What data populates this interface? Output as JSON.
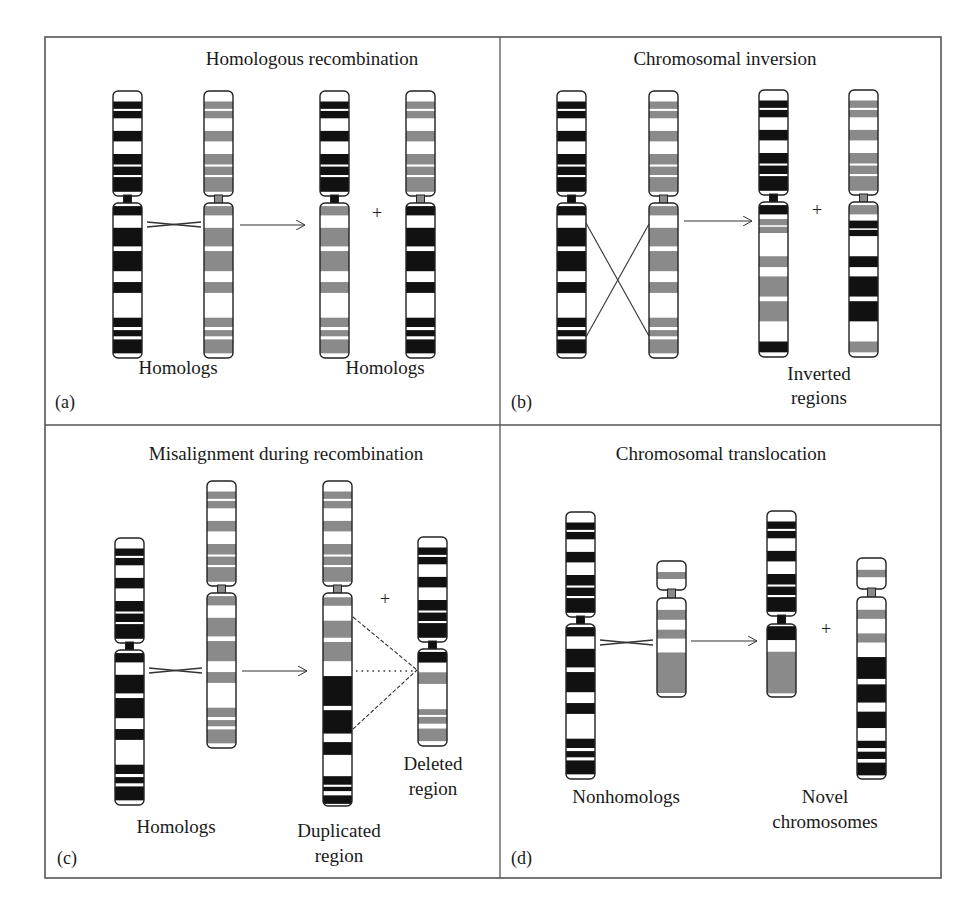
{
  "figure": {
    "frame": {
      "x": 45,
      "y": 37,
      "x2": 941,
      "y2": 878,
      "divider_x": 500,
      "divider_y": 425
    },
    "colors": {
      "dark": "#111111",
      "gray": "#8a8a8a",
      "outline": "#222222",
      "frame": "#555555"
    }
  },
  "patterns": {
    "A_p": [
      [
        0.1,
        0.17,
        "A"
      ],
      [
        0.19,
        0.26,
        "A"
      ],
      [
        0.38,
        0.48,
        "A"
      ],
      [
        0.6,
        0.7,
        "A"
      ],
      [
        0.72,
        0.8,
        "A"
      ],
      [
        0.82,
        0.96,
        "A"
      ]
    ],
    "A_q": [
      [
        0.02,
        0.08,
        "A"
      ],
      [
        0.16,
        0.28,
        "A"
      ],
      [
        0.31,
        0.44,
        "A"
      ],
      [
        0.51,
        0.58,
        "A"
      ],
      [
        0.74,
        0.8,
        "A"
      ],
      [
        0.82,
        0.86,
        "A"
      ],
      [
        0.88,
        0.97,
        "A"
      ]
    ],
    "B_p": [
      [
        0.1,
        0.17,
        "B"
      ],
      [
        0.19,
        0.26,
        "B"
      ],
      [
        0.38,
        0.48,
        "B"
      ],
      [
        0.6,
        0.7,
        "B"
      ],
      [
        0.72,
        0.8,
        "B"
      ],
      [
        0.82,
        0.96,
        "B"
      ]
    ],
    "B_q": [
      [
        0.02,
        0.08,
        "B"
      ],
      [
        0.16,
        0.28,
        "B"
      ],
      [
        0.31,
        0.44,
        "B"
      ],
      [
        0.51,
        0.58,
        "B"
      ],
      [
        0.74,
        0.8,
        "B"
      ],
      [
        0.82,
        0.86,
        "B"
      ],
      [
        0.88,
        0.97,
        "B"
      ]
    ]
  },
  "panels": [
    {
      "id": "a",
      "tag": "(a)",
      "title": "Homologous recombination",
      "title_pos": {
        "x": 272,
        "y": 58
      },
      "tag_pos": {
        "x": 53,
        "y": 398
      },
      "captions": [
        {
          "text": "Homologs",
          "x": 178,
          "y": 368
        },
        {
          "text": "Homologs",
          "x": 385,
          "y": 368
        }
      ],
      "chromosomes": [
        {
          "name": "chromosome-a1",
          "x": 113,
          "y": 91,
          "w": 29,
          "p": 105,
          "c": 7,
          "q": 155,
          "p_bands": "A_p",
          "q_bands": "A_q",
          "cen": "dark"
        },
        {
          "name": "chromosome-a2",
          "x": 204,
          "y": 91,
          "w": 29,
          "p": 105,
          "c": 7,
          "q": 155,
          "p_bands": "B_p",
          "q_bands": "B_q",
          "cen": "gray"
        },
        {
          "name": "chromosome-a3",
          "x": 320,
          "y": 91,
          "w": 29,
          "p": 105,
          "c": 7,
          "q": 155,
          "p_bands": "A_p",
          "q_bands": "B_q",
          "cen": "dark"
        },
        {
          "name": "chromosome-a4",
          "x": 406,
          "y": 91,
          "w": 29,
          "p": 105,
          "c": 7,
          "q": 155,
          "p_bands": "B_p",
          "q_bands": "A_q",
          "cen": "gray"
        }
      ],
      "arrows": [
        {
          "x1": 240,
          "y1": 225,
          "x2": 305,
          "y2": 225
        }
      ],
      "crosses": [
        {
          "x1": 147,
          "x2": 201,
          "y": 225
        }
      ],
      "plus": [
        {
          "text": "+",
          "x": 377,
          "y": 213
        }
      ],
      "lines": [],
      "dashed": [],
      "dotted": []
    },
    {
      "id": "b",
      "tag": "(b)",
      "title": "Chromosomal inversion",
      "title_pos": {
        "x": 725,
        "y": 58
      },
      "tag_pos": {
        "x": 510,
        "y": 398
      },
      "captions": [
        {
          "text": "Inverted",
          "x": 819,
          "y": 368
        },
        {
          "text": "regions",
          "x": 819,
          "y": 392
        }
      ],
      "chromosomes": [
        {
          "name": "chromosome-b1",
          "x": 557,
          "y": 91,
          "w": 29,
          "p": 105,
          "c": 7,
          "q": 155,
          "p_bands": "A_p",
          "q_bands": "A_q",
          "cen": "dark"
        },
        {
          "name": "chromosome-b2",
          "x": 649,
          "y": 91,
          "w": 29,
          "p": 105,
          "c": 7,
          "q": 155,
          "p_bands": "B_p",
          "q_bands": "B_q",
          "cen": "gray"
        },
        {
          "name": "chromosome-b3",
          "x": 759,
          "y": 90,
          "w": 29,
          "p": 105,
          "c": 7,
          "q": 155,
          "p_bands": "A_p",
          "q_bands": "inv_B",
          "cen": "dark"
        },
        {
          "name": "chromosome-b4",
          "x": 849,
          "y": 90,
          "w": 29,
          "p": 105,
          "c": 7,
          "q": 155,
          "p_bands": "B_p",
          "q_bands": "inv_A",
          "cen": "gray"
        }
      ],
      "arrows": [
        {
          "x1": 684,
          "y1": 221,
          "x2": 752,
          "y2": 221
        }
      ],
      "crosses": [],
      "plus": [
        {
          "text": "+",
          "x": 817,
          "y": 210
        }
      ],
      "lines": [
        {
          "x1": 586,
          "y1": 223,
          "x2": 649,
          "y2": 336
        },
        {
          "x1": 586,
          "y1": 337,
          "x2": 649,
          "y2": 224
        }
      ],
      "dashed": [],
      "dotted": []
    },
    {
      "id": "c",
      "tag": "(c)",
      "title": "Misalignment during recombination",
      "title_pos": {
        "x": 286,
        "y": 452
      },
      "tag_pos": {
        "x": 59,
        "y": 851
      },
      "captions": [
        {
          "text": "Homologs",
          "x": 176,
          "y": 815
        },
        {
          "text": "Duplicated",
          "x": 339,
          "y": 820
        },
        {
          "text": "region",
          "x": 339,
          "y": 845
        },
        {
          "text": "Deleted",
          "x": 433,
          "y": 753
        },
        {
          "text": "region",
          "x": 433,
          "y": 778
        }
      ],
      "chromosomes": [
        {
          "name": "chromosome-c1",
          "x": 115,
          "y": 538,
          "w": 29,
          "p": 105,
          "c": 7,
          "q": 155,
          "p_bands": "A_p",
          "q_bands": "A_q",
          "cen": "dark"
        },
        {
          "name": "chromosome-c2",
          "x": 207,
          "y": 481,
          "w": 29,
          "p": 105,
          "c": 7,
          "q": 155,
          "p_bands": "B_p",
          "q_bands": "B_q",
          "cen": "gray"
        },
        {
          "name": "chromosome-c3",
          "x": 323,
          "y": 481,
          "w": 29,
          "p": 105,
          "c": 7,
          "q": 213,
          "p_bands": "B_p",
          "q_bands": "dup",
          "cen": "gray"
        },
        {
          "name": "chromosome-c4",
          "x": 418,
          "y": 537,
          "w": 29,
          "p": 105,
          "c": 7,
          "q": 97,
          "p_bands": "A_p",
          "q_bands": "del",
          "cen": "dark"
        }
      ],
      "arrows": [
        {
          "x1": 242,
          "y1": 671,
          "x2": 307,
          "y2": 671
        }
      ],
      "crosses": [
        {
          "x1": 149,
          "x2": 202,
          "y": 671
        }
      ],
      "plus": [
        {
          "text": "+",
          "x": 385,
          "y": 599
        }
      ],
      "lines": [],
      "dashed": [
        {
          "x1": 353,
          "y1": 617,
          "x2": 417,
          "y2": 670
        },
        {
          "x1": 353,
          "y1": 729,
          "x2": 417,
          "y2": 670
        }
      ],
      "dotted": [
        {
          "x1": 356,
          "y1": 671,
          "x2": 414,
          "y2": 671
        }
      ]
    },
    {
      "id": "d",
      "tag": "(d)",
      "title": "Chromosomal translocation",
      "title_pos": {
        "x": 721,
        "y": 452
      },
      "tag_pos": {
        "x": 510,
        "y": 851
      },
      "captions": [
        {
          "text": "Nonhomologs",
          "x": 626,
          "y": 788
        },
        {
          "text": "Novel",
          "x": 825,
          "y": 786
        },
        {
          "text": "chromosomes",
          "x": 825,
          "y": 811
        }
      ],
      "chromosomes": [
        {
          "name": "chromosome-d1",
          "x": 566,
          "y": 512,
          "w": 29,
          "p": 105,
          "c": 7,
          "q": 155,
          "p_bands": "A_p",
          "q_bands": "A_q",
          "cen": "dark"
        },
        {
          "name": "chromosome-d2",
          "x": 657,
          "y": 561,
          "w": 29,
          "p": 29,
          "c": 8,
          "q": 99,
          "p_bands": "small_p",
          "q_bands": "small_q",
          "cen": "gray"
        },
        {
          "name": "chromosome-d3",
          "x": 767,
          "y": 511,
          "w": 29,
          "p": 105,
          "c": 8,
          "q": 73,
          "p_bands": "A_p",
          "q_bands": "trans_a",
          "cen": "dark"
        },
        {
          "name": "chromosome-d4",
          "x": 857,
          "y": 558,
          "w": 29,
          "p": 31,
          "c": 8,
          "q": 182,
          "p_bands": "small_p",
          "q_bands": "trans_b",
          "cen": "gray"
        }
      ],
      "arrows": [
        {
          "x1": 691,
          "y1": 641,
          "x2": 757,
          "y2": 641
        }
      ],
      "crosses": [
        {
          "x1": 600,
          "x2": 653,
          "y": 643
        }
      ],
      "plus": [
        {
          "text": "+",
          "x": 826,
          "y": 629
        }
      ],
      "lines": [],
      "dashed": [],
      "dotted": []
    }
  ],
  "extra_patterns": {
    "inv_B": [
      [
        0.02,
        0.08,
        "A"
      ],
      [
        0.11,
        0.15,
        "B"
      ],
      [
        0.16,
        0.2,
        "B"
      ],
      [
        0.35,
        0.42,
        "B"
      ],
      [
        0.48,
        0.61,
        "B"
      ],
      [
        0.64,
        0.77,
        "B"
      ],
      [
        0.9,
        0.97,
        "A"
      ]
    ],
    "inv_A": [
      [
        0.02,
        0.08,
        "B"
      ],
      [
        0.12,
        0.17,
        "A"
      ],
      [
        0.18,
        0.22,
        "A"
      ],
      [
        0.35,
        0.42,
        "A"
      ],
      [
        0.48,
        0.61,
        "A"
      ],
      [
        0.64,
        0.77,
        "A"
      ],
      [
        0.9,
        0.97,
        "B"
      ]
    ],
    "dup": [
      [
        0.02,
        0.06,
        "B"
      ],
      [
        0.13,
        0.21,
        "B"
      ],
      [
        0.23,
        0.32,
        "B"
      ],
      [
        0.39,
        0.53,
        "A"
      ],
      [
        0.55,
        0.66,
        "A"
      ],
      [
        0.7,
        0.76,
        "A"
      ],
      [
        0.86,
        0.9,
        "A"
      ],
      [
        0.91,
        0.93,
        "A"
      ],
      [
        0.95,
        0.99,
        "A"
      ]
    ],
    "del": [
      [
        0.03,
        0.14,
        "A"
      ],
      [
        0.24,
        0.36,
        "B"
      ],
      [
        0.62,
        0.68,
        "B"
      ],
      [
        0.7,
        0.77,
        "B"
      ],
      [
        0.82,
        0.95,
        "B"
      ]
    ],
    "small_p": [
      [
        0.38,
        0.62,
        "B"
      ]
    ],
    "small_q": [
      [
        0.12,
        0.22,
        "B"
      ],
      [
        0.32,
        0.41,
        "B"
      ],
      [
        0.55,
        0.96,
        "B"
      ]
    ],
    "trans_a": [
      [
        0.03,
        0.22,
        "A"
      ],
      [
        0.38,
        0.95,
        "B"
      ]
    ],
    "trans_b": [
      [
        0.07,
        0.12,
        "B"
      ],
      [
        0.2,
        0.25,
        "B"
      ],
      [
        0.33,
        0.45,
        "A"
      ],
      [
        0.48,
        0.58,
        "A"
      ],
      [
        0.63,
        0.72,
        "A"
      ],
      [
        0.79,
        0.83,
        "A"
      ],
      [
        0.85,
        0.89,
        "A"
      ],
      [
        0.91,
        0.98,
        "A"
      ]
    ]
  }
}
